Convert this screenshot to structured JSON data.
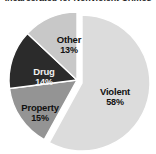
{
  "chart": {
    "title": "Incarcerated for Nonviolent Crimes",
    "background_color": "#ffffff",
    "slice_border_color": "#ffffff"
  },
  "chart_data": {
    "type": "pie",
    "title": "Incarcerated for Nonviolent Crimes",
    "xlabel": "",
    "ylabel": "",
    "grid": false,
    "legend": "none",
    "value_unit": "%",
    "categories": [
      "Violent",
      "Property",
      "Drug",
      "Other"
    ],
    "values": [
      58,
      15,
      14,
      13
    ],
    "slices": [
      {
        "label": "Violent",
        "value": 58,
        "percent_text": "58%",
        "color": "#dcdcdc",
        "exploded": false,
        "label_text_color": "#111111"
      },
      {
        "label": "Property",
        "value": 15,
        "percent_text": "15%",
        "color": "#949494",
        "exploded": true,
        "label_text_color": "#111111"
      },
      {
        "label": "Drug",
        "value": 14,
        "percent_text": "14%",
        "color": "#2b2b2b",
        "exploded": true,
        "label_text_color": "#f2f2f2"
      },
      {
        "label": "Other",
        "value": 13,
        "percent_text": "13%",
        "color": "#c8c8c8",
        "exploded": true,
        "label_text_color": "#111111"
      }
    ]
  }
}
